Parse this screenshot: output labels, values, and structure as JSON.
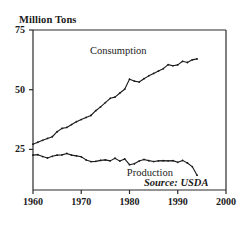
{
  "chart_data": {
    "type": "line",
    "title": "",
    "subtitle": "",
    "xlabel": "",
    "ylabel": "Million Tons",
    "xlim": [
      1960,
      2000
    ],
    "ylim": [
      8,
      75
    ],
    "grid": false,
    "legend_position": "inline-annotations",
    "yticks": [
      25,
      50,
      75
    ],
    "ytick_labels": [
      "25",
      "50",
      "75"
    ],
    "xticks": [
      1960,
      1970,
      1980,
      1990,
      2000
    ],
    "xtick_labels": [
      "1960",
      "1970",
      "1980",
      "1990",
      "2000"
    ],
    "annotations": [
      {
        "text": "Consumption",
        "x": 1977,
        "y": 66
      },
      {
        "text": "Production",
        "x": 1984,
        "y": 15
      },
      {
        "text": "Source: USDA",
        "x": 1989,
        "y": 11
      }
    ],
    "x": [
      1960,
      1961,
      1962,
      1963,
      1964,
      1965,
      1966,
      1967,
      1968,
      1969,
      1970,
      1971,
      1972,
      1973,
      1974,
      1975,
      1976,
      1977,
      1978,
      1979,
      1980,
      1981,
      1982,
      1983,
      1984,
      1985,
      1986,
      1987,
      1988,
      1989,
      1990,
      1991,
      1992,
      1993,
      1994
    ],
    "series": [
      {
        "name": "Consumption",
        "color": "#1a1a1a",
        "values": [
          27.2,
          28.0,
          28.8,
          29.6,
          30.3,
          32.4,
          33.8,
          34.2,
          35.4,
          36.6,
          37.5,
          38.4,
          39.2,
          41.2,
          42.8,
          44.6,
          46.4,
          46.9,
          48.6,
          50.2,
          54.4,
          53.6,
          53.2,
          54.6,
          55.8,
          56.8,
          57.8,
          58.8,
          60.5,
          60.0,
          60.4,
          61.9,
          61.4,
          62.5,
          62.9
        ]
      },
      {
        "name": "Production",
        "color": "#1a1a1a",
        "values": [
          22.6,
          22.8,
          22.0,
          21.4,
          22.1,
          22.6,
          22.7,
          23.3,
          22.6,
          22.3,
          21.9,
          20.6,
          19.9,
          20.0,
          20.4,
          20.6,
          20.2,
          21.3,
          20.1,
          21.0,
          18.6,
          19.0,
          20.1,
          20.8,
          20.3,
          19.9,
          20.2,
          20.3,
          20.2,
          20.3,
          19.6,
          20.4,
          19.3,
          17.8,
          14.2
        ]
      }
    ]
  }
}
